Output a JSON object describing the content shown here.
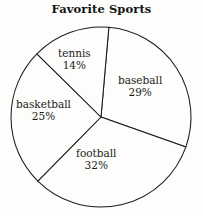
{
  "chart_data": {
    "type": "pie",
    "title": "Favorite Sports",
    "xlabel": "",
    "ylabel": "",
    "legend": "none",
    "grid": false,
    "units": "percent",
    "categories": [
      "baseball",
      "football",
      "basketball",
      "tennis"
    ],
    "values": [
      29,
      32,
      25,
      14
    ],
    "slices": [
      {
        "label": "baseball",
        "value": 29,
        "value_text": "29%",
        "start_angle": 5,
        "sweep_angle": 104.4,
        "label_x": 118,
        "label_y": 74
      },
      {
        "label": "football",
        "value": 32,
        "value_text": "32%",
        "start_angle": 109.4,
        "sweep_angle": 115.2,
        "label_x": 76,
        "label_y": 147
      },
      {
        "label": "basketball",
        "value": 25,
        "value_text": "25%",
        "start_angle": 224.6,
        "sweep_angle": 90,
        "label_x": 16,
        "label_y": 98
      },
      {
        "label": "tennis",
        "value": 14,
        "value_text": "14%",
        "start_angle": 314.6,
        "sweep_angle": 50.4,
        "label_x": 58,
        "label_y": 47
      }
    ],
    "geometry": {
      "center_x": 101,
      "center_y": 117,
      "radius": 90
    },
    "colors": {
      "slice_fill": "#fdfdfb",
      "outline": "#1c1c1c",
      "text": "#1a1a1a",
      "background": "#fdfdfb"
    }
  }
}
